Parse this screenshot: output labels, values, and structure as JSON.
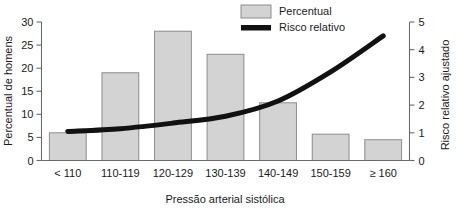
{
  "chart_data": {
    "type": "bar",
    "title": "",
    "xlabel": "Pressão arterial sistólica",
    "ylabel": "Percentual de homens",
    "y2label": "Risco relativo ajustado",
    "categories": [
      "< 110",
      "110-119",
      "120-129",
      "130-139",
      "140-149",
      "150-159",
      "≥ 160"
    ],
    "series": [
      {
        "name": "Percentual",
        "type": "bar",
        "axis": "left",
        "values": [
          6.0,
          19.0,
          28.0,
          23.0,
          12.5,
          5.7,
          4.5
        ]
      },
      {
        "name": "Risco relativo",
        "type": "line",
        "axis": "right",
        "values": [
          1.05,
          1.15,
          1.35,
          1.6,
          2.15,
          3.2,
          4.5
        ]
      }
    ],
    "ylim": [
      0,
      30
    ],
    "yticks": [
      0,
      5,
      10,
      15,
      20,
      25,
      30
    ],
    "y2lim": [
      0,
      5
    ],
    "y2ticks": [
      0,
      1,
      2,
      3,
      4,
      5
    ],
    "grid": false,
    "legend_position": "top-right",
    "colors": {
      "bar_fill": "#d3d3d3",
      "bar_stroke": "#8c8c8c",
      "line": "#111111",
      "axis": "#6a6a6a",
      "text": "#1a1a1a",
      "background": "#ffffff"
    }
  },
  "legend": {
    "items": [
      {
        "label": "Percentual",
        "kind": "swatch"
      },
      {
        "label": "Risco relativo",
        "kind": "line"
      }
    ]
  },
  "axes": {
    "left": {
      "title": "Percentual de homens",
      "ticks": [
        "0",
        "5",
        "10",
        "15",
        "20",
        "25",
        "30"
      ]
    },
    "right": {
      "title": "Risco relativo ajustado",
      "ticks": [
        "0",
        "1",
        "2",
        "3",
        "4",
        "5"
      ]
    },
    "bottom": {
      "title": "Pressão arterial sistólica",
      "ticks": [
        "< 110",
        "110-119",
        "120-129",
        "130-139",
        "140-149",
        "150-159",
        "≥ 160"
      ]
    }
  }
}
